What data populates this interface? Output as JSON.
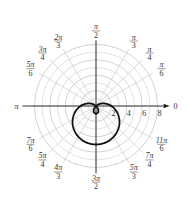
{
  "chart_data": {
    "type": "polar-line",
    "title": "",
    "equation_estimate": "r = 2 - 3 sin(theta)",
    "curve_color": "#111111",
    "grid_color": "#cccccc",
    "radial_ticks": [
      2,
      4,
      6,
      8
    ],
    "radial_tick_labels": [
      "2",
      "4",
      "6",
      "8"
    ],
    "rmax": 9,
    "angle_labels": [
      {
        "angle_deg": 0,
        "text": "0"
      },
      {
        "angle_deg": 30,
        "num": "π",
        "den": "6"
      },
      {
        "angle_deg": 45,
        "num": "π",
        "den": "4"
      },
      {
        "angle_deg": 60,
        "num": "π",
        "den": "3"
      },
      {
        "angle_deg": 90,
        "num": "π",
        "den": "2"
      },
      {
        "angle_deg": 120,
        "num": "2π",
        "den": "3"
      },
      {
        "angle_deg": 135,
        "num": "3π",
        "den": "4"
      },
      {
        "angle_deg": 150,
        "num": "5π",
        "den": "6"
      },
      {
        "angle_deg": 180,
        "text": "π"
      },
      {
        "angle_deg": 210,
        "num": "7π",
        "den": "6"
      },
      {
        "angle_deg": 225,
        "num": "5π",
        "den": "4"
      },
      {
        "angle_deg": 240,
        "num": "4π",
        "den": "3"
      },
      {
        "angle_deg": 270,
        "num": "3π",
        "den": "2"
      },
      {
        "angle_deg": 300,
        "num": "5π",
        "den": "3"
      },
      {
        "angle_deg": 315,
        "num": "7π",
        "den": "4"
      },
      {
        "angle_deg": 330,
        "num": "11π",
        "den": "6"
      }
    ],
    "curve": {
      "a": 2,
      "b": -3,
      "func": "sin",
      "description": "limaçon with inner loop, opening downward"
    }
  }
}
